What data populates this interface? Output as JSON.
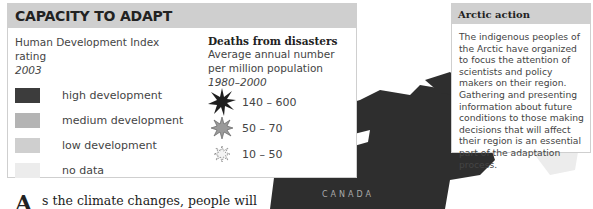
{
  "legend": {
    "title": "CAPACITY TO ADAPT",
    "hdi": {
      "heading_line1": "Human Development Index",
      "heading_line2": "rating",
      "year": "2003",
      "items": [
        {
          "label": "high development",
          "color": "#3c3c3c"
        },
        {
          "label": "medium development",
          "color": "#b4b4b4"
        },
        {
          "label": "low development",
          "color": "#cfcfcf"
        },
        {
          "label": "no data",
          "color": "#ececec"
        }
      ]
    },
    "disasters": {
      "heading": "Deaths from disasters",
      "sub_line1": "Average annual number",
      "sub_line2": "per million population",
      "years": "1980–2000",
      "items": [
        {
          "label": "140 – 600",
          "icon": "large-dark-burst-icon"
        },
        {
          "label": "50 – 70",
          "icon": "medium-gray-burst-icon"
        },
        {
          "label": "10 – 50",
          "icon": "small-outline-burst-icon"
        }
      ]
    }
  },
  "arctic": {
    "title": "Arctic action",
    "body": "The indigenous peoples of the Arctic have organized to focus the attention of scientists and policy makers on their region. Gathering and presenting information about future conditions to those making decisions that will affect their region is an essential part of the adaptation process."
  },
  "map": {
    "label_canada": "CANADA"
  },
  "article": {
    "dropcap": "A",
    "text": "s the climate changes, people will"
  }
}
